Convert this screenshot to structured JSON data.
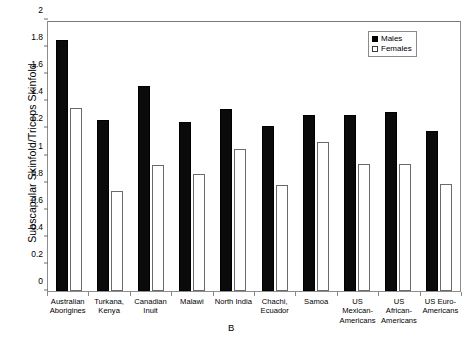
{
  "chart_data": {
    "type": "bar",
    "title": "",
    "panel_label": "B",
    "xlabel": "",
    "ylabel": "Subscapular Skinfold/Triceps Skinfold",
    "ylim": [
      0,
      2
    ],
    "ytick_values": [
      0,
      0.2,
      0.4,
      0.6,
      0.8,
      1,
      1.2,
      1.4,
      1.6,
      1.8,
      2
    ],
    "ytick_labels": [
      "0",
      "0.2",
      "0.4",
      "0.6",
      "0.8",
      "1",
      "1.2",
      "1.4",
      "1.6",
      "1.8",
      "2"
    ],
    "grid": false,
    "legend_position": "top-right",
    "categories": [
      "Australian Aborigines",
      "Turkana, Kenya",
      "Canadian Inuit",
      "Malawi",
      "North India",
      "Chachi, Ecuador",
      "Samoa",
      "US Mexican-Americans",
      "US African-Americans",
      "US Euro-Americans"
    ],
    "category_lines": [
      [
        "Australian",
        "Aborigines"
      ],
      [
        "Turkana,",
        "Kenya"
      ],
      [
        "Canadian",
        "Inuit"
      ],
      [
        "Malawi"
      ],
      [
        "North India"
      ],
      [
        "Chachi,",
        "Ecuador"
      ],
      [
        "Samoa"
      ],
      [
        "US",
        "Mexican-",
        "Americans"
      ],
      [
        "US",
        "African-",
        "Americans"
      ],
      [
        "US Euro-",
        "Americans"
      ]
    ],
    "series": [
      {
        "name": "Males",
        "color": "#000000",
        "values": [
          1.85,
          1.26,
          1.51,
          1.25,
          1.34,
          1.22,
          1.3,
          1.3,
          1.32,
          1.18
        ]
      },
      {
        "name": "Females",
        "color": "#ffffff",
        "values": [
          1.35,
          0.74,
          0.93,
          0.86,
          1.05,
          0.78,
          1.1,
          0.94,
          0.94,
          0.79
        ]
      }
    ]
  },
  "legend": {
    "items": [
      {
        "label": "Males",
        "swatch": "filled-square"
      },
      {
        "label": "Females",
        "swatch": "open-square"
      }
    ]
  }
}
